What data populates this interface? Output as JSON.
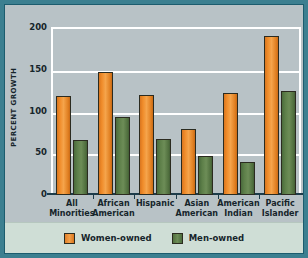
{
  "chart_data": {
    "type": "bar",
    "title": "",
    "xlabel": "",
    "ylabel": "PERCENT GROWTH",
    "ylim": [
      0,
      200
    ],
    "yticks": [
      0,
      50,
      100,
      150,
      200
    ],
    "grid": true,
    "legend_position": "bottom",
    "categories": [
      "All Minorities",
      "African American",
      "Hispanic",
      "Asian American",
      "American Indian",
      "Pacific Islander"
    ],
    "category_lines": [
      [
        "All",
        "Minorities"
      ],
      [
        "African",
        "American"
      ],
      [
        "Hispanic",
        ""
      ],
      [
        "Asian",
        "American"
      ],
      [
        "American",
        "Indian"
      ],
      [
        "Pacific",
        "Islander"
      ]
    ],
    "series": [
      {
        "name": "Women-owned",
        "color": "#ef8b2c",
        "values": [
          118,
          147,
          120,
          79,
          122,
          190
        ]
      },
      {
        "name": "Men-owned",
        "color": "#5d7f49",
        "values": [
          66,
          94,
          67,
          47,
          40,
          125
        ]
      }
    ]
  },
  "colors": {
    "frame": "#3c7f90",
    "plot_background": "#b8c2c6",
    "gridline": "#ffffff",
    "axis": "#1d3c4a",
    "legend_background": "#cfded6",
    "women_bar": "#ef8b2c",
    "men_bar": "#5d7f49",
    "text": "#16252b"
  }
}
